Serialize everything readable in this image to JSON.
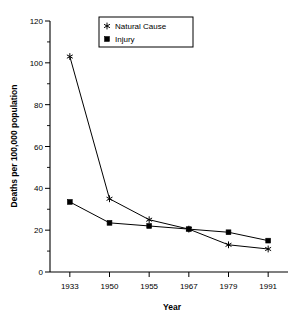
{
  "chart_data": {
    "type": "line",
    "title": "",
    "xlabel": "Year",
    "ylabel": "Deaths per 100,000 population",
    "categories": [
      "1933",
      "1950",
      "1955",
      "1967",
      "1979",
      "1991"
    ],
    "ylim": [
      0,
      120
    ],
    "yticks": [
      0,
      20,
      40,
      60,
      80,
      100,
      120
    ],
    "ytick_labels": [
      "0",
      "20",
      "40",
      "60",
      "80",
      "100",
      "120"
    ],
    "minor_yticks": [
      10,
      30,
      50,
      70,
      90,
      110
    ],
    "grid": false,
    "legend_position": "top-center",
    "series": [
      {
        "name": "Natural Cause",
        "marker": "asterisk",
        "color": "#000000",
        "values": [
          103,
          35,
          25,
          20.5,
          13,
          11
        ]
      },
      {
        "name": "Injury",
        "marker": "square",
        "color": "#000000",
        "values": [
          33.5,
          23.5,
          22,
          20.5,
          19,
          15
        ]
      }
    ]
  },
  "legend": {
    "items": [
      {
        "label": "Natural Cause",
        "marker": "asterisk"
      },
      {
        "label": "Injury",
        "marker": "square"
      }
    ]
  },
  "colors": {
    "ink": "#000000",
    "background": "#ffffff"
  }
}
